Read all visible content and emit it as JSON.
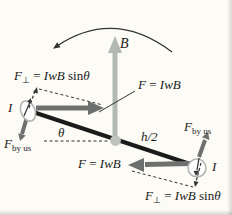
{
  "colors": {
    "background": "#fcfbf6",
    "rod": "#1b1b1b",
    "field_arrow": "#b2b8b4",
    "force_arrow": "#6d706e",
    "pivot": "#bfc3bf",
    "thin_line": "#333333",
    "loop_outline": "#b5b5b5",
    "current_arrow": "#3a3a3a"
  },
  "labels": {
    "b_field": "B",
    "theta": "θ",
    "half_height": "h/2",
    "current_left": "I",
    "current_right": "I"
  },
  "formulas": {
    "force": {
      "lhs": "F",
      "eq": " = ",
      "rhs": "IwB"
    },
    "force_perp": {
      "lhs": "F",
      "sub": "⊥",
      "eq": " = ",
      "rhs": "IwB",
      "fn": " sin",
      "angle": "θ"
    },
    "force_by_us": {
      "lhs": "F",
      "sub": "by us"
    }
  }
}
